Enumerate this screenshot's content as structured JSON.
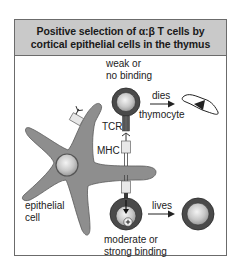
{
  "header": {
    "title_line1": "Positive selection of α:β T cells by",
    "title_line2": "cortical epithelial cells in the thymus"
  },
  "labels": {
    "weak_line1": "weak or",
    "weak_line2": "no binding",
    "dies": "dies",
    "thymocyte": "thymocyte",
    "tcr": "TCR",
    "mhc": "MHC",
    "epithelial_line1": "epithelial",
    "epithelial_line2": "cell",
    "lives": "lives",
    "moderate_line1": "moderate or",
    "moderate_line2": "strong binding"
  },
  "colors": {
    "header_bg": "#c9c9c9",
    "epithelial_cell": "#8e8e8e",
    "thymocyte_ring": "#4a4a4a",
    "nucleus": "#c4c4c4",
    "receptor_dark": "#555555",
    "mhc_light": "#e8e8e8"
  }
}
